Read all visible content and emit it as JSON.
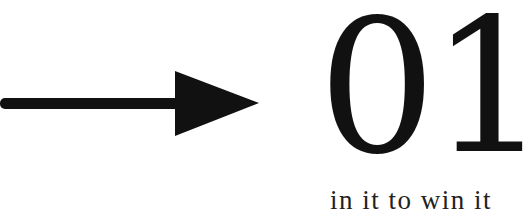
{
  "graphic": {
    "arrow_icon": "right-arrow",
    "numeral": "01",
    "tagline": "in it to win it",
    "color": "#111111",
    "background": "#ffffff"
  }
}
